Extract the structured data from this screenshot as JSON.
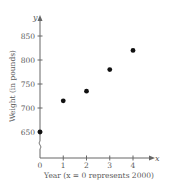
{
  "chart_data": {
    "type": "scatter",
    "title": "",
    "xlabel": "Year (x = 0 represents 2000)",
    "ylabel": "Weight (in pounds)",
    "x_axis_var": "x",
    "y_axis_var": "y",
    "x": [
      0,
      1,
      2,
      3,
      4
    ],
    "y": [
      650,
      715,
      735,
      780,
      820
    ],
    "x_ticks": [
      0,
      1,
      2,
      3,
      4
    ],
    "x_tick_labels": [
      "0",
      "1",
      "2",
      "3",
      "4"
    ],
    "y_ticks": [
      650,
      700,
      750,
      800,
      850
    ],
    "y_tick_labels": [
      "650",
      "700",
      "750",
      "800",
      "850"
    ],
    "xlim": [
      0,
      4.8
    ],
    "ylim": [
      600,
      880
    ],
    "y_axis_break": true,
    "grid": false,
    "legend": null,
    "marker_color": "#111111",
    "axis_color": "#666666"
  }
}
